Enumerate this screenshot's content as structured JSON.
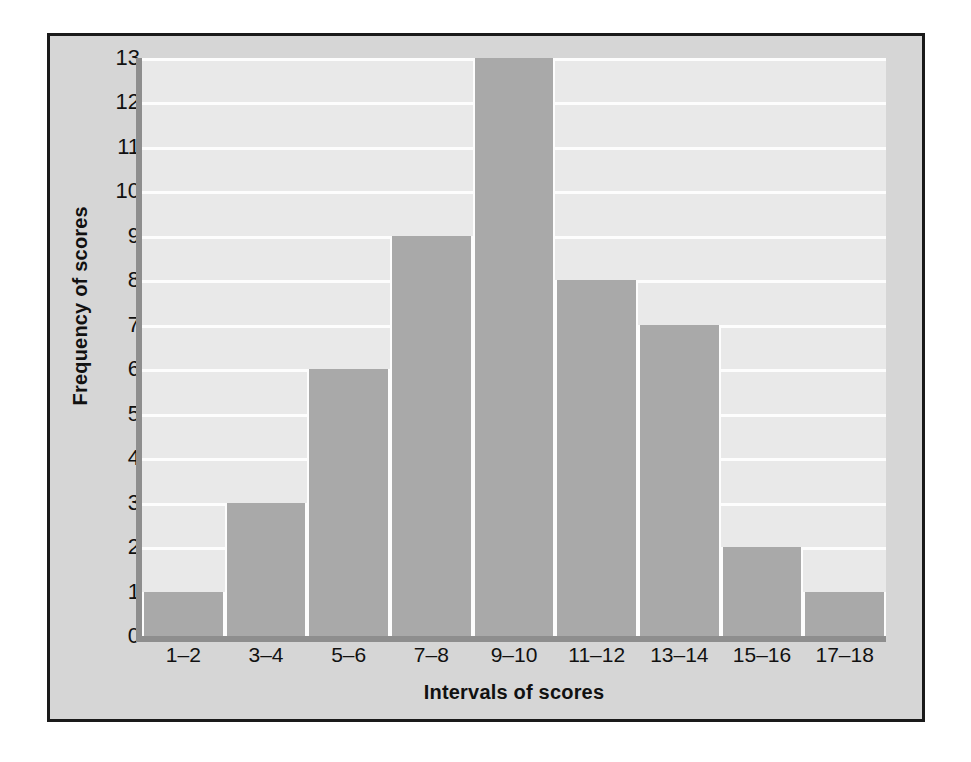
{
  "chart_data": {
    "type": "bar",
    "title": "",
    "xlabel": "Intervals of scores",
    "ylabel": "Frequency of scores",
    "categories": [
      "1–2",
      "3–4",
      "5–6",
      "7–8",
      "9–10",
      "11–12",
      "13–14",
      "15–16",
      "17–18"
    ],
    "values": [
      1,
      3,
      6,
      9,
      13,
      8,
      7,
      2,
      1
    ],
    "ylim": [
      0,
      13
    ],
    "ytick_labels": [
      "13",
      "12",
      "11",
      "10",
      "9",
      "8",
      "7",
      "6",
      "5",
      "4",
      "3",
      "2",
      "1",
      "0"
    ],
    "ytick_values": [
      13,
      12,
      11,
      10,
      9,
      8,
      7,
      6,
      5,
      4,
      3,
      2,
      1,
      0
    ],
    "grid": true,
    "legend": false,
    "colors": {
      "bar_fill": "#a9a9a9",
      "plot_background": "#e9e9e9",
      "gridline": "#fdfdfd",
      "axis_line": "#8e8e8e",
      "figure_background": "#d6d6d6",
      "figure_border": "#1a1a1a",
      "text": "#111111",
      "page_background": "#ffffff"
    }
  }
}
